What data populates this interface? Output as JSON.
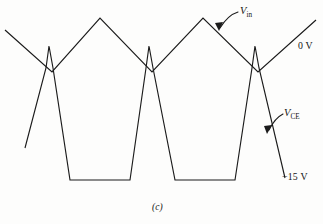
{
  "figure": {
    "caption": "(c)",
    "labels": {
      "v_in": {
        "symbol": "V",
        "subscript": "in"
      },
      "v_ce": {
        "symbol": "V",
        "subscript": "CE"
      }
    },
    "levels": {
      "zero": "0 V",
      "negative": "−15 V"
    },
    "stroke_color": "#1b1b1b",
    "background_color": "#fdfdfc"
  },
  "chart_data": {
    "type": "line",
    "title": "(c)",
    "xlabel": "",
    "ylabel": "",
    "xlim": [
      0,
      323
    ],
    "ylim": [
      224,
      0
    ],
    "grid": false,
    "legend": "inline-annotations",
    "annotations": [
      {
        "text": "V_in",
        "x": 240,
        "y": 12,
        "arrow_to": [
          218,
          30
        ]
      },
      {
        "text": "V_CE",
        "x": 284,
        "y": 114,
        "arrow_to": [
          268,
          132
        ]
      },
      {
        "text": "0 V",
        "x": 298,
        "y": 46
      },
      {
        "text": "−15 V",
        "x": 282,
        "y": 178
      }
    ],
    "series": [
      {
        "name": "V_in",
        "description": "Triangular input waveform riding about the 0 V level",
        "points": [
          [
            5,
            30
          ],
          [
            52,
            72
          ],
          [
            100,
            18
          ],
          [
            152,
            72
          ],
          [
            203,
            18
          ],
          [
            258,
            72
          ],
          [
            316,
            20
          ]
        ]
      },
      {
        "name": "V_CE",
        "description": "Clipped collector-emitter waveform with narrow positive spikes at each crossing and flat bottoms clamped near −15 V",
        "points": [
          [
            25,
            148
          ],
          [
            46,
            68
          ],
          [
            49,
            46
          ],
          [
            53,
            68
          ],
          [
            70,
            180
          ],
          [
            130,
            180
          ],
          [
            146,
            68
          ],
          [
            149,
            46
          ],
          [
            153,
            68
          ],
          [
            175,
            180
          ],
          [
            235,
            180
          ],
          [
            252,
            68
          ],
          [
            255,
            46
          ],
          [
            259,
            68
          ],
          [
            285,
            178
          ]
        ]
      }
    ]
  }
}
